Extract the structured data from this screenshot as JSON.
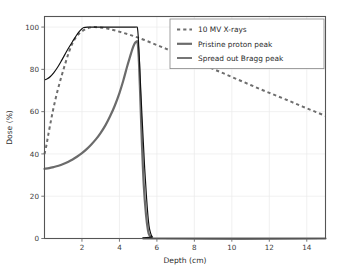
{
  "chart_data": {
    "type": "line",
    "title": "",
    "xlabel": "Depth (cm)",
    "ylabel": "Dose (%)",
    "xlim": [
      0,
      15
    ],
    "ylim": [
      0,
      105
    ],
    "xticks": [
      2,
      4,
      6,
      8,
      10,
      12,
      14
    ],
    "xtick_labels": [
      "2",
      "4",
      "6",
      "8",
      "10",
      "12",
      "14"
    ],
    "yticks": [
      0,
      20,
      40,
      60,
      80,
      100
    ],
    "ytick_labels": [
      "0",
      "20",
      "40",
      "60",
      "80",
      "100"
    ],
    "grid": true,
    "legend_position": "upper right",
    "series": [
      {
        "name": "10 MV X-rays",
        "style": "dashed",
        "color": "#6e6e6e",
        "x": [
          0.0,
          0.1,
          0.2,
          0.35,
          0.5,
          0.7,
          0.9,
          1.1,
          1.3,
          1.5,
          1.75,
          2.0,
          2.3,
          2.6,
          3.0,
          3.4,
          3.8,
          4.2,
          4.6,
          5.0,
          5.5,
          6.0,
          6.5,
          7.0,
          7.5,
          8.0,
          8.5,
          9.0,
          9.5,
          10.0,
          10.5,
          11.0,
          11.5,
          12.0,
          12.5,
          13.0,
          13.5,
          14.0,
          14.5,
          15.0
        ],
        "y": [
          40.0,
          44.0,
          49.0,
          56.0,
          62.5,
          70.0,
          76.5,
          82.5,
          88.0,
          92.5,
          96.0,
          98.0,
          99.4,
          100.0,
          99.8,
          99.2,
          98.3,
          97.3,
          96.2,
          95.0,
          93.3,
          91.5,
          89.7,
          87.8,
          85.9,
          84.0,
          82.1,
          80.2,
          78.3,
          76.4,
          74.5,
          72.6,
          70.7,
          68.9,
          67.1,
          65.3,
          63.4,
          61.6,
          59.8,
          58.0
        ]
      },
      {
        "name": "Pristine proton peak",
        "style": "solid-thick",
        "color": "#6b6b6b",
        "x": [
          0.0,
          0.25,
          0.5,
          0.75,
          1.0,
          1.25,
          1.5,
          1.75,
          2.0,
          2.25,
          2.5,
          2.75,
          3.0,
          3.25,
          3.5,
          3.75,
          4.0,
          4.2,
          4.4,
          4.55,
          4.7,
          4.8,
          4.88,
          4.93,
          4.96,
          5.0,
          5.05,
          5.12,
          5.2,
          5.3,
          5.42,
          5.52,
          5.6,
          5.75,
          6.0,
          15.0
        ],
        "y": [
          33.0,
          33.3,
          33.8,
          34.4,
          35.2,
          36.2,
          37.4,
          38.8,
          40.4,
          42.3,
          44.5,
          47.0,
          50.0,
          53.5,
          57.8,
          62.8,
          68.8,
          74.5,
          81.0,
          85.5,
          89.8,
          92.0,
          93.0,
          93.3,
          93.0,
          90.0,
          82.0,
          65.0,
          45.0,
          25.0,
          11.0,
          4.0,
          1.5,
          0.4,
          0.0,
          0.0
        ]
      },
      {
        "name": "Spread out Bragg peak",
        "style": "solid-thin",
        "color": "#101010",
        "x": [
          0.0,
          0.15,
          0.3,
          0.5,
          0.7,
          0.9,
          1.1,
          1.3,
          1.5,
          1.7,
          1.85,
          2.0,
          2.1,
          2.3,
          2.6,
          3.0,
          3.5,
          4.0,
          4.4,
          4.7,
          4.85,
          4.92,
          4.96,
          5.0,
          5.06,
          5.14,
          5.25,
          5.35,
          5.45,
          5.52,
          5.58,
          5.65,
          5.75,
          6.0,
          15.0
        ],
        "y": [
          75.0,
          75.5,
          76.5,
          78.5,
          81.0,
          84.0,
          87.2,
          90.3,
          93.2,
          96.0,
          97.8,
          99.2,
          99.8,
          100.0,
          100.0,
          100.0,
          100.0,
          100.0,
          100.0,
          100.0,
          100.0,
          100.0,
          99.6,
          96.0,
          86.0,
          70.0,
          50.0,
          33.0,
          19.0,
          11.0,
          6.0,
          3.0,
          0.9,
          0.0,
          0.0
        ]
      }
    ],
    "legend_entries": [
      {
        "label": "10 MV X-rays",
        "sample": "dashed-line-sample"
      },
      {
        "label": "Pristine proton peak",
        "sample": "thick-line-sample"
      },
      {
        "label": "Spread out Bragg peak",
        "sample": "thin-line-sample"
      }
    ]
  }
}
